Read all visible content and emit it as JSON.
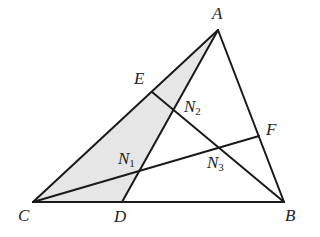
{
  "diagram": {
    "type": "triangle-geometry",
    "fill_color": "#e6e6e6",
    "stroke_color": "#1a1a1a",
    "points": {
      "A": [
        218,
        30
      ],
      "B": [
        284,
        202
      ],
      "C": [
        33,
        202
      ],
      "D": [
        122,
        202
      ],
      "E": [
        152,
        92
      ],
      "F": [
        259,
        136
      ],
      "N1": [
        138,
        171
      ],
      "N2": [
        173,
        111
      ],
      "N3": [
        219,
        147
      ]
    },
    "segments": [
      [
        "A",
        "B"
      ],
      [
        "B",
        "C"
      ],
      [
        "C",
        "A"
      ],
      [
        "A",
        "D"
      ],
      [
        "B",
        "E"
      ],
      [
        "C",
        "F"
      ]
    ],
    "shaded_region": [
      "C",
      "A",
      "D"
    ],
    "labels": {
      "A": "A",
      "B": "B",
      "C": "C",
      "D": "D",
      "E": "E",
      "F": "F",
      "N1": "N",
      "N1_sub": "1",
      "N2": "N",
      "N2_sub": "2",
      "N3": "N",
      "N3_sub": "3"
    }
  }
}
